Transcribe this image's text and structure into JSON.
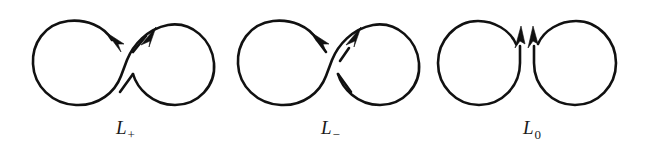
{
  "diagram": {
    "background_color": "#ffffff",
    "stroke_color": "#111111",
    "figures": [
      {
        "id": "l-plus",
        "label_main": "L",
        "label_sub": "+",
        "label_text": "L+",
        "crossing_type": "positive",
        "over_strand": "upper-left-to-lower-right",
        "under_strand": "lower-left-to-upper-right",
        "components": 1,
        "arrow_count": 2,
        "arrow_directions": [
          "up-left",
          "up-right"
        ],
        "shape": "figure-eight"
      },
      {
        "id": "l-minus",
        "label_main": "L",
        "label_sub": "−",
        "label_text": "L-",
        "crossing_type": "negative",
        "over_strand": "lower-left-to-upper-right",
        "under_strand": "upper-left-to-lower-right",
        "components": 1,
        "arrow_count": 2,
        "arrow_directions": [
          "up-left",
          "up-right"
        ],
        "shape": "figure-eight"
      },
      {
        "id": "l-zero",
        "label_main": "L",
        "label_sub": "0",
        "label_text": "L0",
        "crossing_type": "smoothing",
        "over_strand": "none",
        "under_strand": "none",
        "components": 2,
        "arrow_count": 2,
        "arrow_directions": [
          "up",
          "up"
        ],
        "shape": "two-tangent-circles"
      }
    ]
  }
}
